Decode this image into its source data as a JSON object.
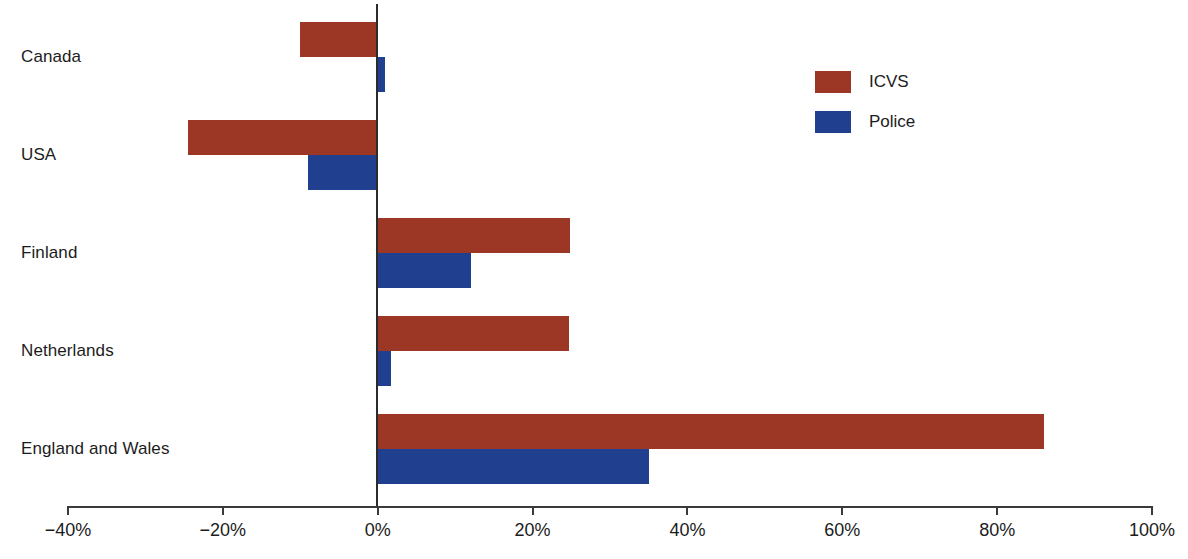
{
  "chart_data": {
    "type": "bar",
    "orientation": "horizontal",
    "title": "",
    "subtitle": "",
    "xlabel": "",
    "ylabel": "",
    "xlim": [
      -40,
      100
    ],
    "xticks": [
      -40,
      -20,
      0,
      20,
      40,
      60,
      80,
      100
    ],
    "xtick_labels": [
      "−40%",
      "−20%",
      "0%",
      "20%",
      "40%",
      "60%",
      "80%",
      "100%"
    ],
    "grid": false,
    "legend_position": "top-right",
    "categories": [
      "Canada",
      "USA",
      "Finland",
      "Netherlands",
      "England and Wales"
    ],
    "series": [
      {
        "name": "ICVS",
        "color": "#9c3725",
        "values": [
          -10,
          -24.5,
          24.8,
          24.7,
          86
        ]
      },
      {
        "name": "Police",
        "color": "#20408f",
        "values": [
          1,
          -9,
          12,
          1.7,
          35
        ]
      }
    ]
  },
  "legend": {
    "items": [
      {
        "label": "ICVS",
        "color": "#9c3725"
      },
      {
        "label": "Police",
        "color": "#20408f"
      }
    ]
  },
  "axis": {
    "zero_value": "0%"
  }
}
